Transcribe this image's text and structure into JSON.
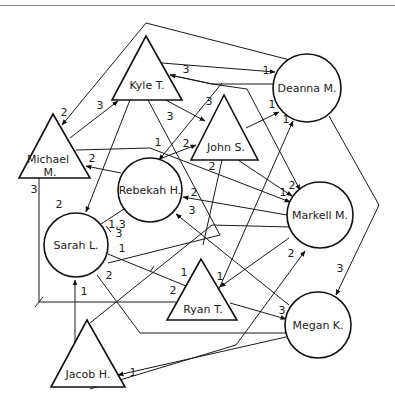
{
  "diagram": {
    "type": "sociogram",
    "legend_shapes": {
      "triangle": "male",
      "circle": "female"
    },
    "nodes": [
      {
        "id": "kyle",
        "label": "Kyle T.",
        "shape": "triangle",
        "lx": 147,
        "ly": 86
      },
      {
        "id": "michael",
        "label_line1": "Michael",
        "label_line2": "M.",
        "shape": "triangle",
        "lx": 48,
        "ly": 162
      },
      {
        "id": "john",
        "label": "John S.",
        "shape": "triangle",
        "lx": 226,
        "ly": 148
      },
      {
        "id": "deanna",
        "label": "Deanna M.",
        "shape": "circle",
        "lx": 307,
        "ly": 92
      },
      {
        "id": "rebekah",
        "label": "Rebekah H.",
        "shape": "circle",
        "lx": 150,
        "ly": 193
      },
      {
        "id": "markell",
        "label": "Markell M.",
        "shape": "circle",
        "lx": 320,
        "ly": 219
      },
      {
        "id": "sarah",
        "label": "Sarah L.",
        "shape": "circle",
        "lx": 76,
        "ly": 249
      },
      {
        "id": "ryan",
        "label": "Ryan T.",
        "shape": "triangle",
        "lx": 202,
        "ly": 310
      },
      {
        "id": "megan",
        "label": "Megan K.",
        "shape": "circle",
        "lx": 318,
        "ly": 329
      },
      {
        "id": "jacob",
        "label": "Jacob H.",
        "shape": "triangle",
        "lx": 88,
        "ly": 376
      }
    ],
    "edge_labels": [
      {
        "text": "3",
        "x": 186,
        "y": 73
      },
      {
        "text": "1",
        "x": 266,
        "y": 74
      },
      {
        "text": "3",
        "x": 100,
        "y": 109
      },
      {
        "text": "2",
        "x": 64,
        "y": 116
      },
      {
        "text": "3",
        "x": 170,
        "y": 120
      },
      {
        "text": "3",
        "x": 209,
        "y": 105
      },
      {
        "text": "1",
        "x": 272,
        "y": 108
      },
      {
        "text": "1",
        "x": 286,
        "y": 123
      },
      {
        "text": "1",
        "x": 158,
        "y": 146
      },
      {
        "text": "2",
        "x": 186,
        "y": 147
      },
      {
        "text": "2",
        "x": 92,
        "y": 162
      },
      {
        "text": "2",
        "x": 212,
        "y": 170
      },
      {
        "text": "2",
        "x": 194,
        "y": 196
      },
      {
        "text": "2",
        "x": 292,
        "y": 189
      },
      {
        "text": "1",
        "x": 283,
        "y": 196
      },
      {
        "text": "3",
        "x": 34,
        "y": 193
      },
      {
        "text": "2",
        "x": 59,
        "y": 208
      },
      {
        "text": "1,3",
        "x": 117,
        "y": 228
      },
      {
        "text": "3",
        "x": 192,
        "y": 214
      },
      {
        "text": "3",
        "x": 119,
        "y": 237
      },
      {
        "text": "1",
        "x": 122,
        "y": 252
      },
      {
        "text": "2",
        "x": 291,
        "y": 257
      },
      {
        "text": "3",
        "x": 340,
        "y": 272
      },
      {
        "text": "2",
        "x": 109,
        "y": 279
      },
      {
        "text": "1",
        "x": 184,
        "y": 276
      },
      {
        "text": "1",
        "x": 220,
        "y": 280
      },
      {
        "text": "1",
        "x": 84,
        "y": 295
      },
      {
        "text": "2",
        "x": 173,
        "y": 294
      },
      {
        "text": "3",
        "x": 282,
        "y": 314
      },
      {
        "text": "1",
        "x": 133,
        "y": 376
      }
    ]
  }
}
